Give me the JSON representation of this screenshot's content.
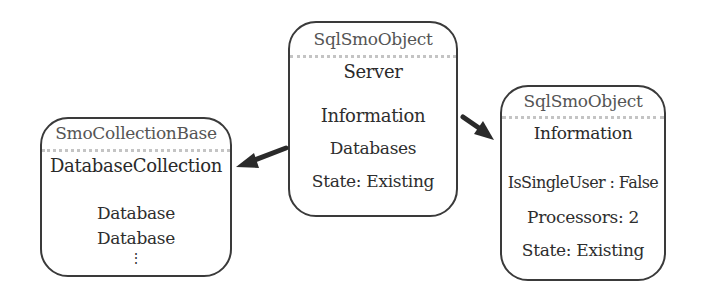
{
  "diagram": {
    "nodes": [
      {
        "id": "collection",
        "base_type": "SmoCollectionBase",
        "class_name": "DatabaseCollection",
        "items": [
          "Database",
          "Database"
        ],
        "ellipsis": "⋮"
      },
      {
        "id": "server",
        "base_type": "SqlSmoObject",
        "class_name": "Server",
        "items": [
          "Information",
          "Databases",
          "State: Existing"
        ]
      },
      {
        "id": "information",
        "base_type": "SqlSmoObject",
        "class_name": "Information",
        "items": [
          "IsSingleUser : False",
          "Processors: 2",
          "State: Existing"
        ]
      }
    ],
    "edges": [
      {
        "from": "server",
        "to": "collection",
        "label": ""
      },
      {
        "from": "server",
        "to": "information",
        "label": ""
      }
    ]
  }
}
